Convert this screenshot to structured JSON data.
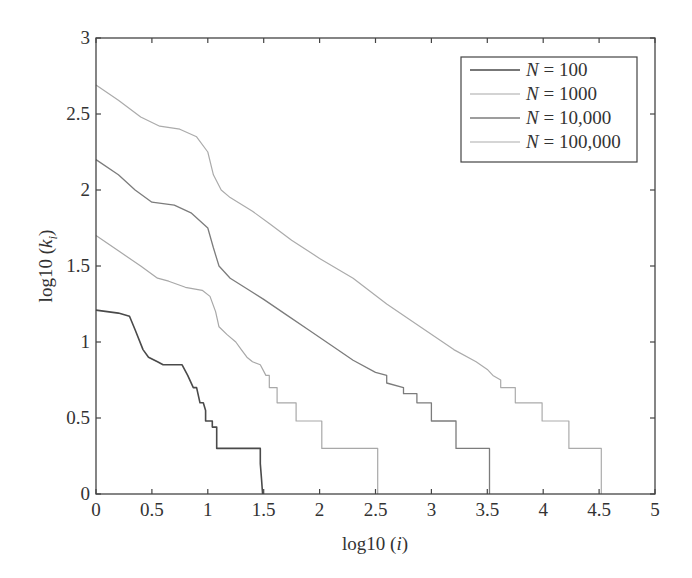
{
  "chart_data": {
    "type": "line",
    "title": "",
    "xlabel": "log10 (i)",
    "ylabel": "log10 (k_i)",
    "xlim": [
      0,
      5
    ],
    "ylim": [
      0,
      3
    ],
    "grid": false,
    "legend_position": "upper right",
    "xticks": [
      "0",
      "0.5",
      "1",
      "1.5",
      "2",
      "2.5",
      "3",
      "3.5",
      "4",
      "4.5",
      "5"
    ],
    "yticks": [
      "0",
      "0.5",
      "1",
      "1.5",
      "2",
      "2.5",
      "3"
    ],
    "series": [
      {
        "name": "N = 100",
        "color": "#4a4a4a",
        "width": 1.6,
        "points": [
          [
            0,
            1.21
          ],
          [
            0.1,
            1.2
          ],
          [
            0.2,
            1.19
          ],
          [
            0.3,
            1.17
          ],
          [
            0.35,
            1.08
          ],
          [
            0.42,
            0.95
          ],
          [
            0.47,
            0.9
          ],
          [
            0.55,
            0.87
          ],
          [
            0.6,
            0.85
          ],
          [
            0.77,
            0.85
          ],
          [
            0.82,
            0.78
          ],
          [
            0.87,
            0.7
          ],
          [
            0.9,
            0.7
          ],
          [
            0.93,
            0.6
          ],
          [
            0.96,
            0.6
          ],
          [
            0.98,
            0.55
          ],
          [
            0.98,
            0.48
          ],
          [
            1.04,
            0.48
          ],
          [
            1.04,
            0.44
          ],
          [
            1.08,
            0.44
          ],
          [
            1.08,
            0.3
          ],
          [
            1.18,
            0.3
          ],
          [
            1.18,
            0.3
          ],
          [
            1.47,
            0.3
          ],
          [
            1.47,
            0.2
          ],
          [
            1.48,
            0.1
          ],
          [
            1.49,
            0
          ]
        ]
      },
      {
        "name": "N = 1000",
        "color": "#a8a8a8",
        "width": 1.2,
        "points": [
          [
            0,
            1.7
          ],
          [
            0.2,
            1.6
          ],
          [
            0.4,
            1.5
          ],
          [
            0.55,
            1.42
          ],
          [
            0.65,
            1.4
          ],
          [
            0.8,
            1.36
          ],
          [
            0.95,
            1.34
          ],
          [
            1.02,
            1.3
          ],
          [
            1.07,
            1.2
          ],
          [
            1.1,
            1.1
          ],
          [
            1.17,
            1.05
          ],
          [
            1.25,
            1.0
          ],
          [
            1.3,
            0.95
          ],
          [
            1.35,
            0.9
          ],
          [
            1.4,
            0.87
          ],
          [
            1.47,
            0.85
          ],
          [
            1.52,
            0.78
          ],
          [
            1.55,
            0.78
          ],
          [
            1.55,
            0.7
          ],
          [
            1.62,
            0.7
          ],
          [
            1.62,
            0.6
          ],
          [
            1.79,
            0.6
          ],
          [
            1.79,
            0.48
          ],
          [
            2.02,
            0.48
          ],
          [
            2.02,
            0.3
          ],
          [
            2.25,
            0.3
          ],
          [
            2.25,
            0.3
          ],
          [
            2.52,
            0.3
          ],
          [
            2.52,
            0
          ]
        ]
      },
      {
        "name": "N = 10,000",
        "color": "#7c7c7c",
        "width": 1.3,
        "points": [
          [
            0,
            2.2
          ],
          [
            0.2,
            2.1
          ],
          [
            0.35,
            2.0
          ],
          [
            0.5,
            1.92
          ],
          [
            0.7,
            1.9
          ],
          [
            0.85,
            1.85
          ],
          [
            1.0,
            1.75
          ],
          [
            1.05,
            1.62
          ],
          [
            1.1,
            1.5
          ],
          [
            1.2,
            1.42
          ],
          [
            1.35,
            1.35
          ],
          [
            1.5,
            1.28
          ],
          [
            1.7,
            1.18
          ],
          [
            1.9,
            1.08
          ],
          [
            2.1,
            0.98
          ],
          [
            2.3,
            0.88
          ],
          [
            2.5,
            0.8
          ],
          [
            2.6,
            0.78
          ],
          [
            2.6,
            0.73
          ],
          [
            2.75,
            0.7
          ],
          [
            2.75,
            0.66
          ],
          [
            2.87,
            0.66
          ],
          [
            2.87,
            0.6
          ],
          [
            3.0,
            0.6
          ],
          [
            3.0,
            0.48
          ],
          [
            3.22,
            0.48
          ],
          [
            3.22,
            0.3
          ],
          [
            3.52,
            0.3
          ],
          [
            3.52,
            0
          ]
        ]
      },
      {
        "name": "N = 100,000",
        "color": "#ababab",
        "width": 1.2,
        "points": [
          [
            0,
            2.69
          ],
          [
            0.2,
            2.59
          ],
          [
            0.4,
            2.48
          ],
          [
            0.57,
            2.42
          ],
          [
            0.75,
            2.4
          ],
          [
            0.9,
            2.35
          ],
          [
            1.0,
            2.25
          ],
          [
            1.05,
            2.1
          ],
          [
            1.12,
            2.0
          ],
          [
            1.2,
            1.95
          ],
          [
            1.4,
            1.86
          ],
          [
            1.55,
            1.78
          ],
          [
            1.75,
            1.67
          ],
          [
            2.0,
            1.55
          ],
          [
            2.3,
            1.42
          ],
          [
            2.6,
            1.25
          ],
          [
            2.9,
            1.1
          ],
          [
            3.2,
            0.95
          ],
          [
            3.4,
            0.87
          ],
          [
            3.5,
            0.82
          ],
          [
            3.55,
            0.78
          ],
          [
            3.62,
            0.75
          ],
          [
            3.62,
            0.7
          ],
          [
            3.75,
            0.7
          ],
          [
            3.75,
            0.6
          ],
          [
            3.99,
            0.6
          ],
          [
            3.99,
            0.48
          ],
          [
            4.23,
            0.48
          ],
          [
            4.23,
            0.3
          ],
          [
            4.52,
            0.3
          ],
          [
            4.52,
            0
          ]
        ]
      }
    ]
  }
}
